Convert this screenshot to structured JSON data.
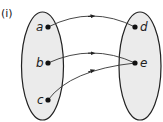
{
  "diagram": {
    "label": "(i)",
    "domain_set": [
      "a",
      "b",
      "c"
    ],
    "codomain_set": [
      "d",
      "e"
    ],
    "mappings": [
      {
        "from": "a",
        "to": "d"
      },
      {
        "from": "b",
        "to": "e"
      },
      {
        "from": "c",
        "to": "e"
      }
    ],
    "colors": {
      "set_fill": "#ebebeb",
      "stroke": "#222222"
    }
  }
}
